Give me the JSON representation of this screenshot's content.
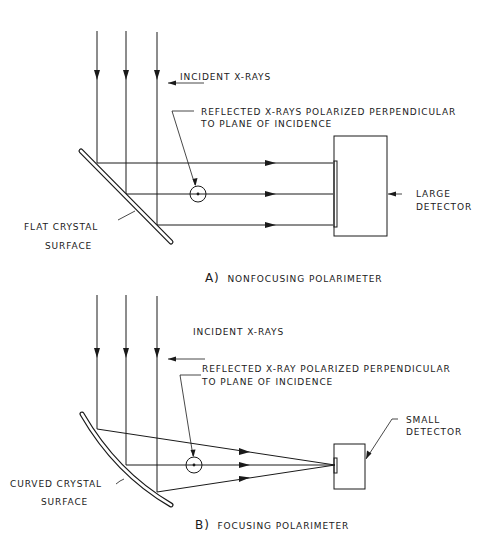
{
  "panel_a": {
    "caption_letter": "A)",
    "caption_text": "NONFOCUSING POLARIMETER",
    "incident_label": "INCIDENT X-RAYS",
    "reflected_label_line1": "REFLECTED X-RAYS POLARIZED PERPENDICULAR",
    "reflected_label_line2": "TO PLANE OF INCIDENCE",
    "crystal_label_line1": "FLAT CRYSTAL",
    "crystal_label_line2": "SURFACE",
    "detector_label_line1": "LARGE",
    "detector_label_line2": "DETECTOR"
  },
  "panel_b": {
    "caption_letter": "B)",
    "caption_text": "FOCUSING POLARIMETER",
    "incident_label": "INCIDENT X-RAYS",
    "reflected_label_line1": "REFLECTED X-RAY POLARIZED PERPENDICULAR",
    "reflected_label_line2": "TO PLANE OF INCIDENCE",
    "crystal_label_line1": "CURVED CRYSTAL",
    "crystal_label_line2": "SURFACE",
    "detector_label_line1": "SMALL",
    "detector_label_line2": "DETECTOR"
  },
  "colors": {
    "ink": "#1a1a1a",
    "background": "#ffffff"
  }
}
